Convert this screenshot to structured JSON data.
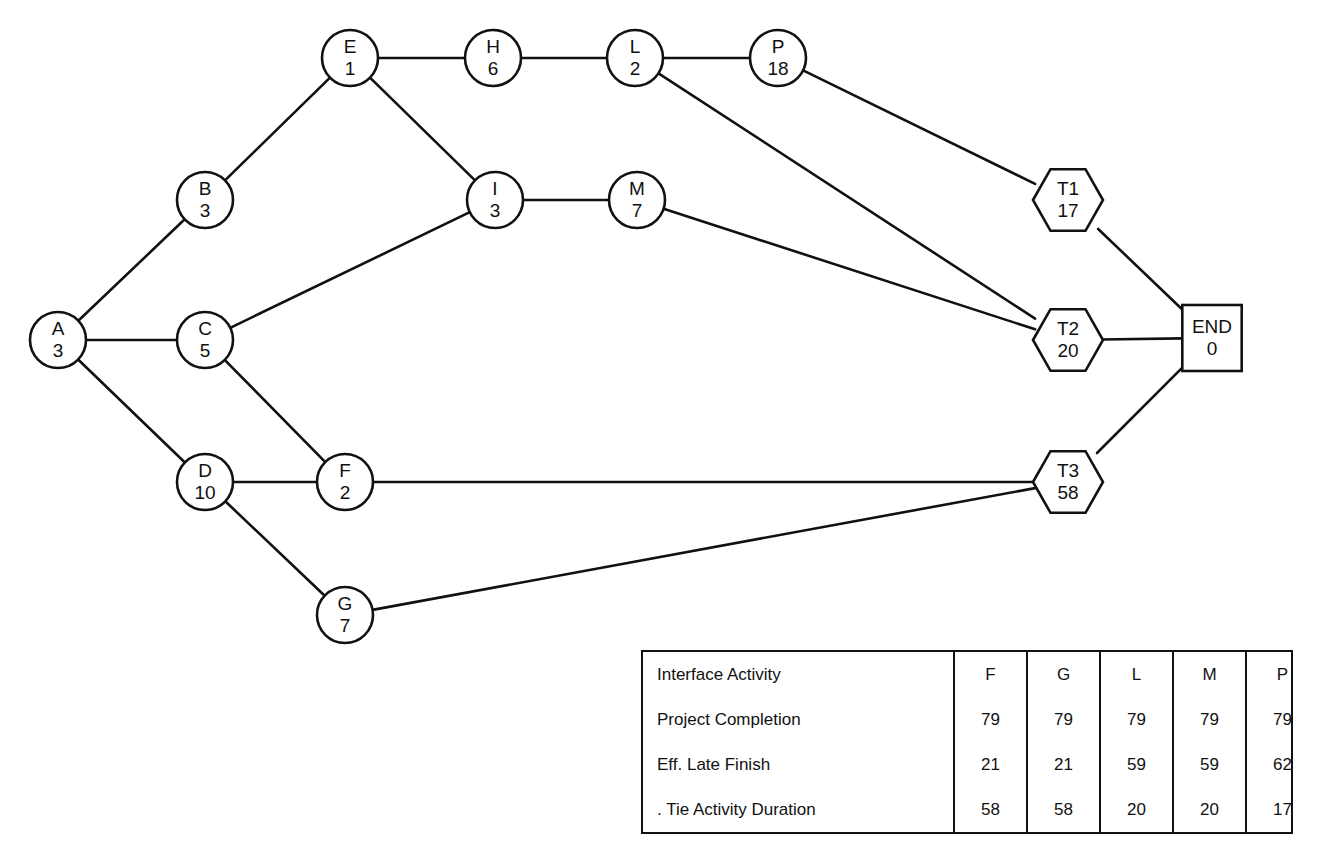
{
  "diagram": {
    "stroke_color": "#111111",
    "background_color": "#ffffff",
    "nodes": [
      {
        "id": "A",
        "label": "A",
        "duration": "3",
        "shape": "circle",
        "x": 58,
        "y": 340,
        "r": 28
      },
      {
        "id": "B",
        "label": "B",
        "duration": "3",
        "shape": "circle",
        "x": 205,
        "y": 200,
        "r": 28
      },
      {
        "id": "C",
        "label": "C",
        "duration": "5",
        "shape": "circle",
        "x": 205,
        "y": 340,
        "r": 28
      },
      {
        "id": "D",
        "label": "D",
        "duration": "10",
        "shape": "circle",
        "x": 205,
        "y": 482,
        "r": 28
      },
      {
        "id": "E",
        "label": "E",
        "duration": "1",
        "shape": "circle",
        "x": 350,
        "y": 58,
        "r": 28
      },
      {
        "id": "F",
        "label": "F",
        "duration": "2",
        "shape": "circle",
        "x": 345,
        "y": 482,
        "r": 28
      },
      {
        "id": "G",
        "label": "G",
        "duration": "7",
        "shape": "circle",
        "x": 345,
        "y": 615,
        "r": 28
      },
      {
        "id": "H",
        "label": "H",
        "duration": "6",
        "shape": "circle",
        "x": 493,
        "y": 58,
        "r": 28
      },
      {
        "id": "I",
        "label": "I",
        "duration": "3",
        "shape": "circle",
        "x": 495,
        "y": 200,
        "r": 28
      },
      {
        "id": "L",
        "label": "L",
        "duration": "2",
        "shape": "circle",
        "x": 635,
        "y": 58,
        "r": 28
      },
      {
        "id": "M",
        "label": "M",
        "duration": "7",
        "shape": "circle",
        "x": 637,
        "y": 200,
        "r": 28
      },
      {
        "id": "P",
        "label": "P",
        "duration": "18",
        "shape": "circle",
        "x": 778,
        "y": 58,
        "r": 28
      },
      {
        "id": "T1",
        "label": "T1",
        "duration": "17",
        "shape": "hexagon",
        "x": 1068,
        "y": 200,
        "r": 35
      },
      {
        "id": "T2",
        "label": "T2",
        "duration": "20",
        "shape": "hexagon",
        "x": 1068,
        "y": 340,
        "r": 35
      },
      {
        "id": "T3",
        "label": "T3",
        "duration": "58",
        "shape": "hexagon",
        "x": 1068,
        "y": 482,
        "r": 35
      },
      {
        "id": "END",
        "label": "END",
        "duration": "0",
        "shape": "rect",
        "x": 1212,
        "y": 338,
        "r": 33
      }
    ],
    "edges": [
      {
        "from": "A",
        "to": "B"
      },
      {
        "from": "A",
        "to": "C"
      },
      {
        "from": "A",
        "to": "D"
      },
      {
        "from": "B",
        "to": "E"
      },
      {
        "from": "C",
        "to": "I"
      },
      {
        "from": "C",
        "to": "F"
      },
      {
        "from": "D",
        "to": "F"
      },
      {
        "from": "D",
        "to": "G"
      },
      {
        "from": "E",
        "to": "H"
      },
      {
        "from": "E",
        "to": "I"
      },
      {
        "from": "H",
        "to": "L"
      },
      {
        "from": "I",
        "to": "M"
      },
      {
        "from": "L",
        "to": "P"
      },
      {
        "from": "L",
        "to": "T2"
      },
      {
        "from": "M",
        "to": "T2"
      },
      {
        "from": "P",
        "to": "T1"
      },
      {
        "from": "F",
        "to": "T3"
      },
      {
        "from": "G",
        "to": "T3"
      },
      {
        "from": "T1",
        "to": "END"
      },
      {
        "from": "T2",
        "to": "END"
      },
      {
        "from": "T3",
        "to": "END"
      }
    ]
  },
  "table": {
    "row_labels": [
      "Interface Activity",
      "Project Completion",
      "Eff. Late Finish",
      ". Tie Activity Duration"
    ],
    "rows": [
      {
        "label": "Interface Activity",
        "values": [
          "F",
          "G",
          "L",
          "M",
          "P"
        ]
      },
      {
        "label": "Project Completion",
        "values": [
          "79",
          "79",
          "79",
          "79",
          "79"
        ]
      },
      {
        "label": "Eff. Late Finish",
        "values": [
          "21",
          "21",
          "59",
          "59",
          "62"
        ]
      },
      {
        "label": ". Tie Activity Duration",
        "values": [
          "58",
          "58",
          "20",
          "20",
          "17"
        ]
      }
    ]
  }
}
